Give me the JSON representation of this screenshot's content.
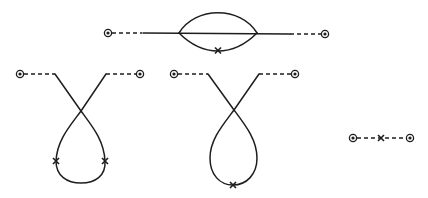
{
  "figure": {
    "colors": {
      "ink": "#1e1e1e",
      "background": "#ffffff"
    },
    "diagrams": [
      {
        "name": "bubble-diagram",
        "external_vertices": [
          [
            108,
            33
          ],
          [
            325,
            34
          ]
        ],
        "dashed_segments": [
          [
            [
              112,
              33
            ],
            [
              142,
              33
            ]
          ],
          [
            [
              290,
              34
            ],
            [
              321,
              34
            ]
          ]
        ],
        "solid_line": [
          [
            143,
            33
          ],
          [
            290,
            34
          ]
        ],
        "bubble_vertices": [
          [
            179,
            33
          ],
          [
            257,
            33
          ]
        ],
        "crosses": [
          [
            218,
            50
          ]
        ]
      },
      {
        "name": "loop-diagram-two-crosses",
        "external_vertices": [
          [
            20,
            74
          ],
          [
            140,
            74
          ]
        ],
        "crossing_point": [
          81,
          111
        ],
        "crosses": [
          [
            56,
            161
          ],
          [
            105,
            161
          ]
        ]
      },
      {
        "name": "loop-diagram-one-cross",
        "external_vertices": [
          [
            174,
            74
          ],
          [
            295,
            74
          ]
        ],
        "crossing_point": [
          234,
          110
        ],
        "crosses": [
          [
            233,
            185
          ]
        ]
      },
      {
        "name": "simple-line-diagram",
        "external_vertices": [
          [
            353,
            138
          ],
          [
            410,
            138
          ]
        ],
        "crosses": [
          [
            381,
            138
          ]
        ]
      }
    ]
  }
}
